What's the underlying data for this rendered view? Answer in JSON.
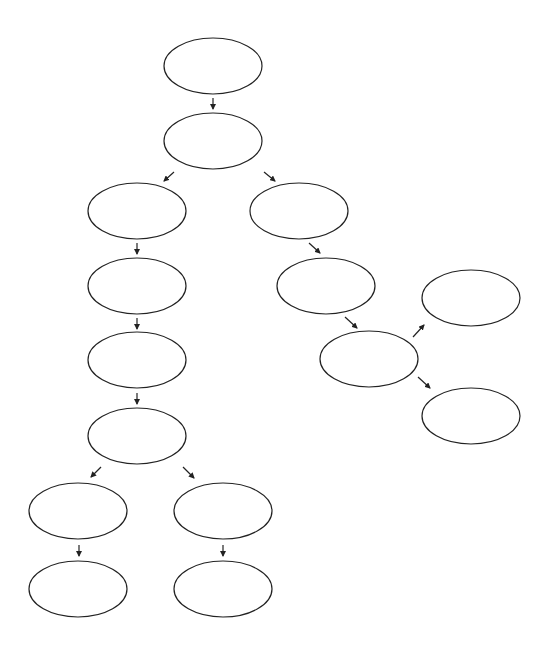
{
  "diagram": {
    "type": "tree-flowchart",
    "stroke_color": "#222222",
    "background": "#ffffff",
    "nodes": [
      {
        "id": "n1",
        "label": "",
        "cx": 213,
        "cy": 66
      },
      {
        "id": "n2",
        "label": "",
        "cx": 213,
        "cy": 141
      },
      {
        "id": "n3",
        "label": "",
        "cx": 137,
        "cy": 211
      },
      {
        "id": "n4",
        "label": "",
        "cx": 299,
        "cy": 211
      },
      {
        "id": "n5",
        "label": "",
        "cx": 137,
        "cy": 286
      },
      {
        "id": "n6",
        "label": "",
        "cx": 137,
        "cy": 360
      },
      {
        "id": "n7",
        "label": "",
        "cx": 137,
        "cy": 436
      },
      {
        "id": "n8",
        "label": "",
        "cx": 78,
        "cy": 511
      },
      {
        "id": "n9",
        "label": "",
        "cx": 223,
        "cy": 511
      },
      {
        "id": "n10",
        "label": "",
        "cx": 78,
        "cy": 589
      },
      {
        "id": "n11",
        "label": "",
        "cx": 223,
        "cy": 589
      },
      {
        "id": "n12",
        "label": "",
        "cx": 326,
        "cy": 286
      },
      {
        "id": "n13",
        "label": "",
        "cx": 369,
        "cy": 359
      },
      {
        "id": "n14",
        "label": "",
        "cx": 471,
        "cy": 298
      },
      {
        "id": "n15",
        "label": "",
        "cx": 471,
        "cy": 416
      }
    ],
    "edges": [
      [
        "n1",
        "n2"
      ],
      [
        "n2",
        "n3"
      ],
      [
        "n2",
        "n4"
      ],
      [
        "n3",
        "n5"
      ],
      [
        "n5",
        "n6"
      ],
      [
        "n6",
        "n7"
      ],
      [
        "n7",
        "n8"
      ],
      [
        "n7",
        "n9"
      ],
      [
        "n8",
        "n10"
      ],
      [
        "n9",
        "n11"
      ],
      [
        "n4",
        "n12"
      ],
      [
        "n12",
        "n13"
      ],
      [
        "n13",
        "n14"
      ],
      [
        "n13",
        "n15"
      ]
    ]
  }
}
